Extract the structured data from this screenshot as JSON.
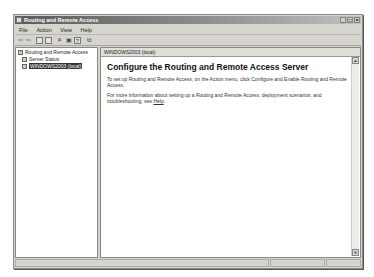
{
  "window": {
    "title": "Routing and Remote Access",
    "buttons": {
      "minimize": "_",
      "maximize": "□",
      "close": "×"
    }
  },
  "menu": [
    "File",
    "Action",
    "View",
    "Help"
  ],
  "toolbar": {
    "back": "⇦",
    "forward": "⇨",
    "items": [
      "up-icon",
      "show-hide-tree-icon",
      "delete-icon",
      "properties-icon",
      "help-icon",
      "export-icon"
    ]
  },
  "tree": {
    "root": "Routing and Remote Access",
    "items": [
      {
        "label": "Server Status",
        "selected": false
      },
      {
        "label": "WINDOWS2003 (local)",
        "selected": true
      }
    ]
  },
  "right_pane": {
    "header": "WINDOWS2003 (local)",
    "heading": "Configure the Routing and Remote Access Server",
    "para1": "To set up Routing and Remote Access, on the Action menu, click Configure and Enable Routing and Remote Access.",
    "para2_prefix": "For more information about setting up a Routing and Remote Access, deployment scenarios, and troubleshooting, see ",
    "para2_link": "Help",
    "para2_suffix": "."
  },
  "scrollbar": {
    "up": "▲",
    "down": "▼"
  }
}
